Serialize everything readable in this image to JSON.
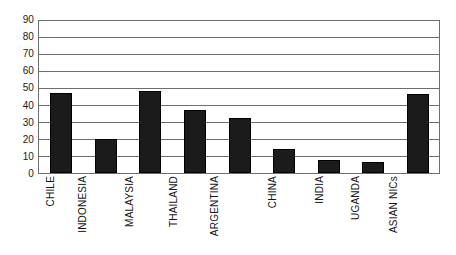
{
  "chart_data": {
    "type": "bar",
    "title": "",
    "subtitle": "",
    "xlabel": "",
    "ylabel": "",
    "categories": [
      "CHILE",
      "INDONESIA",
      "MALAYSIA",
      "THAILAND",
      "ARGENTINA",
      "CHINA",
      "INDIA",
      "UGANDA",
      "ASIAN NICs"
    ],
    "values": [
      47,
      20,
      48,
      37,
      32,
      14,
      7.5,
      6,
      46.5
    ],
    "ylim": [
      0,
      90
    ],
    "ytick_step": 10,
    "yticks": [
      90,
      80,
      70,
      60,
      50,
      40,
      30,
      20,
      10,
      0
    ],
    "ytick_labels": [
      "90",
      "80",
      "70",
      "60",
      "50",
      "40",
      "30",
      "20",
      "10",
      "0"
    ],
    "grid": true,
    "grid_axis": "y",
    "legend": false,
    "legend_position": "none",
    "bar_color": "#1b1b1b",
    "grid_color": "#6e6e6e",
    "axis_color": "#6e6e6e",
    "background_color": "#ffffff",
    "label_rotation": -90,
    "series": [
      {
        "name": "value",
        "values": [
          47,
          20,
          48,
          37,
          32,
          14,
          7.5,
          6,
          46.5
        ]
      }
    ]
  }
}
